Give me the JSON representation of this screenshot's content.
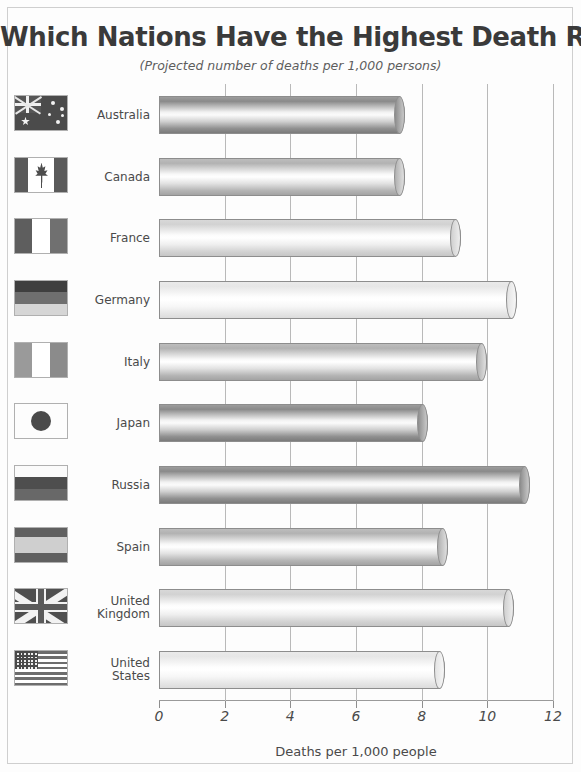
{
  "chart_data": {
    "type": "bar",
    "orientation": "horizontal",
    "title": "Which Nations Have the Highest Death Rates?",
    "subtitle": "(Projected number of deaths per 1,000 persons)",
    "xlabel": "Deaths per 1,000 people",
    "ylabel": "",
    "xlim": [
      0,
      12
    ],
    "xticks": [
      0,
      2,
      4,
      6,
      8,
      10,
      12
    ],
    "xtick_labels": [
      "0",
      "2",
      "4",
      "6",
      "8",
      "10",
      "12"
    ],
    "grid": true,
    "legend": "none",
    "categories": [
      "Australia",
      "Canada",
      "France",
      "Germany",
      "Italy",
      "Japan",
      "Russia",
      "Spain",
      "United Kingdom",
      "United States"
    ],
    "values": [
      7.5,
      7.5,
      9.2,
      10.9,
      10.0,
      8.2,
      11.3,
      8.8,
      10.8,
      8.7
    ]
  },
  "rows": [
    {
      "label": "Australia",
      "value": 7.5,
      "flag": "flag-australia",
      "shade": "dark"
    },
    {
      "label": "Canada",
      "value": 7.5,
      "flag": "flag-canada",
      "shade": "medium"
    },
    {
      "label": "France",
      "value": 9.2,
      "flag": "flag-france",
      "shade": "light"
    },
    {
      "label": "Germany",
      "value": 10.9,
      "flag": "flag-germany",
      "shade": "pale"
    },
    {
      "label": "Italy",
      "value": 10.0,
      "flag": "flag-italy",
      "shade": "medium"
    },
    {
      "label": "Japan",
      "value": 8.2,
      "flag": "flag-japan",
      "shade": "dark"
    },
    {
      "label": "Russia",
      "value": 11.3,
      "flag": "flag-russia",
      "shade": "dark"
    },
    {
      "label": "Spain",
      "value": 8.8,
      "flag": "flag-spain",
      "shade": "medium"
    },
    {
      "label": "United Kingdom",
      "value": 10.8,
      "flag": "flag-united-kingdom",
      "shade": "light"
    },
    {
      "label": "United States",
      "value": 8.7,
      "flag": "flag-united-states",
      "shade": "pale"
    }
  ],
  "colors": {
    "page_background": "#fdfdfd",
    "border": "#cfcfcf",
    "gridline": "#b9b9b9",
    "text": "#4a4a4a",
    "title": "#3a3a3a",
    "bar_outline": "#8d8d8d"
  }
}
